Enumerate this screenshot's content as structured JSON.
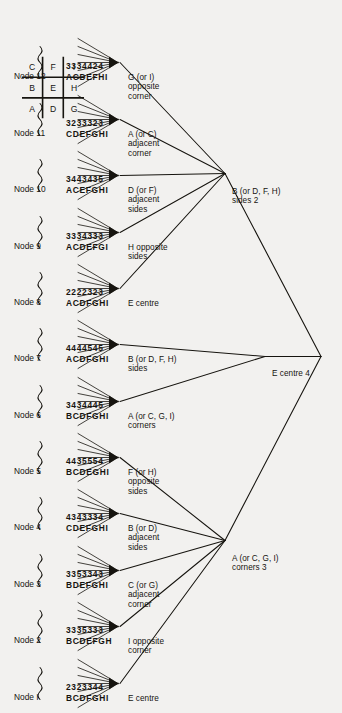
{
  "figure": {
    "orientation": "rotated-90",
    "background": "#f2f1ef",
    "ink": "#16140f"
  },
  "board": {
    "name": "tic-tac-toe-key-grid",
    "cells": [
      "A",
      "B",
      "C",
      "D",
      "E",
      "F",
      "G",
      "H",
      "I"
    ]
  },
  "root": {
    "label": ""
  },
  "level1": [
    {
      "id": "n-corners",
      "label": "A (or C, G, I)\ncorners 3"
    },
    {
      "id": "n-centre",
      "label": "E centre 4"
    },
    {
      "id": "n-sides",
      "label": "B (or D, F, H)\nsides 2"
    }
  ],
  "leaves": [
    {
      "node": "Node I",
      "label": "E centre",
      "letters": "BCDFGHI",
      "numbers": "2323344"
    },
    {
      "node": "Node 2",
      "label": "I opposite\ncorner",
      "letters": "BCDEFGH",
      "numbers": "3335333"
    },
    {
      "node": "Node 3",
      "label": "C (or G)\nadjacent\ncorner",
      "letters": "BDEFGHI",
      "numbers": "3353343"
    },
    {
      "node": "Node 4",
      "label": "B (or D)\nadjacent\nsides",
      "letters": "CDEFGHI",
      "numbers": "4343334"
    },
    {
      "node": "Node 5",
      "label": "F (or H)\nopposite\nsides",
      "letters": "BCDEGHI",
      "numbers": "4435554"
    },
    {
      "node": "Node 6",
      "label": "A (or C, G, I)\ncorners",
      "letters": "BCDFGHI",
      "numbers": "3434445"
    },
    {
      "node": "Node 7",
      "label": "B (or D, F, H)\nsides",
      "letters": "ACDFGHI",
      "numbers": "4444545"
    },
    {
      "node": "Node 8",
      "label": "E centre",
      "letters": "ACDFGHI",
      "numbers": "2222323"
    },
    {
      "node": "Node 9",
      "label": "H opposite\nsides",
      "letters": "ACDEFGI",
      "numbers": "3334333"
    },
    {
      "node": "Node 10",
      "label": "D (or F)\nadjacent\nsides",
      "letters": "ACEFGHI",
      "numbers": "3443435"
    },
    {
      "node": "Node 11",
      "label": "A (or C)\nadjacent\ncorner",
      "letters": "CDEFGHI",
      "numbers": "3233323"
    },
    {
      "node": "Node 12",
      "label": "G (or I)\nopposite\ncorner",
      "letters": "ACDEFHI",
      "numbers": "3334424"
    }
  ]
}
